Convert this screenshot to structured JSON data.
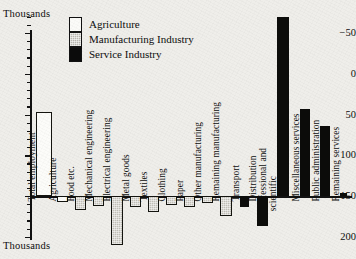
{
  "axis": {
    "unit_caption_top": "Thousands",
    "unit_caption_bottom": "Thousands",
    "tick_labels": [
      "200",
      "150",
      "100",
      "50",
      "0",
      "−50"
    ]
  },
  "legend": {
    "items": [
      {
        "label": "Agriculture",
        "swatch": "agriculture-swatch",
        "color": "#fbfbf8"
      },
      {
        "label": "Manufacturing Industry",
        "swatch": "manufacturing-swatch",
        "color": "#b9b7b0"
      },
      {
        "label": "Service Industry",
        "swatch": "service-swatch",
        "color": "#0b0b0b"
      }
    ]
  },
  "chart_data": {
    "type": "bar",
    "title": "",
    "subtitle": "",
    "xlabel": "",
    "ylabel": "Thousands",
    "ylim": [
      -55,
      235
    ],
    "yticks": [
      -50,
      0,
      50,
      100,
      150,
      200
    ],
    "ytick_minor_step": 10,
    "grid": false,
    "legend_position": "top-left",
    "orientation": "vertical",
    "baseline": 0,
    "categories": [
      "Total employment",
      "Agriculture",
      "Food etc.",
      "Mechanical engineering",
      "Electrical engineering",
      "Metal goods",
      "Textiles",
      "Clothing",
      "Paper",
      "Other manufacturing",
      "Remaining manufacturing",
      "Transport",
      "Distribution",
      "Professional and\nscientific",
      "Miscellaneous services",
      "Public administration",
      "Remaining services"
    ],
    "values": [
      103,
      -7,
      -17,
      -12,
      -60,
      -14,
      -20,
      -11,
      -13,
      -8,
      -24,
      -13,
      -37,
      220,
      107,
      86,
      4
    ],
    "groups": [
      "Agriculture",
      "Agriculture",
      "Manufacturing Industry",
      "Manufacturing Industry",
      "Manufacturing Industry",
      "Manufacturing Industry",
      "Manufacturing Industry",
      "Manufacturing Industry",
      "Manufacturing Industry",
      "Manufacturing Industry",
      "Manufacturing Industry",
      "Service Industry",
      "Service Industry",
      "Service Industry",
      "Service Industry",
      "Service Industry",
      "Service Industry"
    ]
  }
}
